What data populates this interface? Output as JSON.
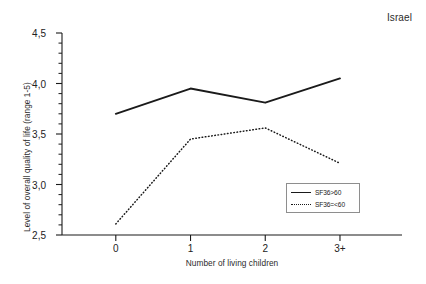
{
  "chart_data": {
    "type": "line",
    "title": "Israel",
    "xlabel": "Number of living children",
    "ylabel": "Level of overall quality of life (range 1-5)",
    "categories": [
      "0",
      "1",
      "2",
      "3+"
    ],
    "ylim": [
      2.5,
      4.5
    ],
    "ytick_labels": [
      "2,5",
      "3,0",
      "3,5",
      "4,0",
      "4,5"
    ],
    "ytick_values": [
      2.5,
      3.0,
      3.5,
      4.0,
      4.5
    ],
    "minor_ticks": true,
    "grid": false,
    "legend_position": "inside-lower-right",
    "series": [
      {
        "name": "SF36>60",
        "style": "solid",
        "color": "#1a1a1a",
        "values": [
          3.7,
          3.95,
          3.81,
          4.05
        ]
      },
      {
        "name": "SF36=<60",
        "style": "dotted",
        "color": "#1a1a1a",
        "values": [
          2.61,
          3.45,
          3.56,
          3.21
        ]
      }
    ]
  },
  "axes": {
    "y_title": "Level of overall quality of life (range 1-5)",
    "x_title": "Number of living children"
  },
  "legend": {
    "items": [
      {
        "label": "SF36>60"
      },
      {
        "label": "SF36=<60"
      }
    ]
  },
  "header": {
    "corner_title": "Israel"
  }
}
